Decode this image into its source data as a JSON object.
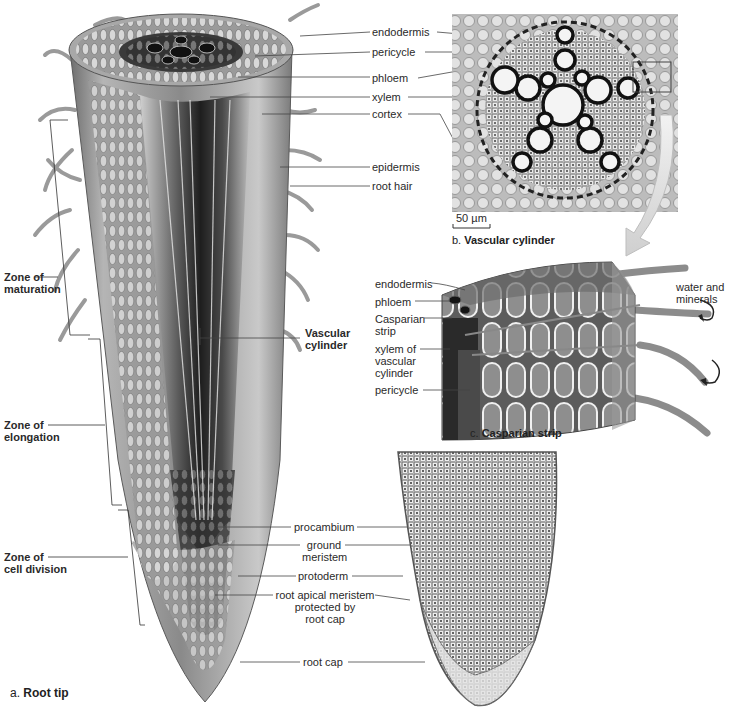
{
  "figure": {
    "panel_a": {
      "caption_letter": "a.",
      "caption_title": "Root tip",
      "labels_right_top": [
        "endodermis",
        "pericycle",
        "phloem",
        "xylem",
        "cortex",
        "epidermis",
        "root hair"
      ],
      "vascular_cylinder": [
        "Vascular",
        "cylinder"
      ],
      "zones": [
        {
          "line1": "Zone of",
          "line2": "maturation"
        },
        {
          "line1": "Zone of",
          "line2": "elongation"
        },
        {
          "line1": "Zone of",
          "line2": "cell division"
        }
      ],
      "labels_bottom": {
        "procambium": "procambium",
        "ground_meristem": [
          "ground",
          "meristem"
        ],
        "protoderm": "protoderm",
        "root_apical_meristem": [
          "root apical meristem",
          "protected by",
          "root cap"
        ],
        "root_cap": "root cap"
      }
    },
    "panel_b": {
      "caption_letter": "b.",
      "caption_title": "Vascular cylinder",
      "scale_bar": "50 µm"
    },
    "panel_c": {
      "caption_letter": "c.",
      "caption_title": "Casparian strip",
      "labels": {
        "endodermis": "endodermis",
        "phloem": "phloem",
        "casparian": [
          "Casparian",
          "strip"
        ],
        "xylem": [
          "xylem of",
          "vascular",
          "cylinder"
        ],
        "pericycle": "pericycle"
      },
      "water_label": [
        "water and",
        "minerals"
      ]
    }
  }
}
